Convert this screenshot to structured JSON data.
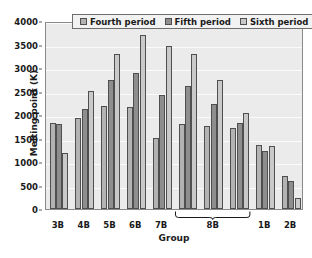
{
  "chart_data": {
    "type": "bar",
    "title": "",
    "xlabel": "Group",
    "ylabel": "Melting point (K)",
    "ylim": [
      0,
      4000
    ],
    "ytick_labels": [
      "0",
      "500",
      "1000",
      "1500",
      "2000",
      "2500",
      "3000",
      "3500",
      "4000"
    ],
    "ytick_values": [
      0,
      500,
      1000,
      1500,
      2000,
      2500,
      3000,
      3500,
      4000
    ],
    "grid": true,
    "legend_position": "top-center",
    "categories": [
      "3B",
      "4B",
      "5B",
      "6B",
      "7B",
      "8B",
      "8B",
      "8B",
      "1B",
      "2B"
    ],
    "xtick_labels": [
      "3B",
      "4B",
      "5B",
      "6B",
      "7B",
      "8B",
      "1B",
      "2B"
    ],
    "bracket_label": "8B",
    "bracket_spans_groups": 3,
    "series": [
      {
        "name": "Fourth period",
        "color": "#b3b3b3",
        "values": [
          1828,
          1941,
          2183,
          2180,
          1519,
          1811,
          1768,
          1728,
          1358,
          693
        ]
      },
      {
        "name": "Fifth period",
        "color": "#8e8e8e",
        "values": [
          1799,
          2128,
          2750,
          2896,
          2430,
          2607,
          2237,
          1828,
          1235,
          594
        ]
      },
      {
        "name": "Sixth period",
        "color": "#c9c9c9",
        "values": [
          1193,
          2506,
          3290,
          3695,
          3459,
          3306,
          2739,
          2041,
          1337,
          234
        ]
      }
    ]
  },
  "legend": {
    "entries": [
      {
        "label": "Fourth period",
        "swatch": "p4"
      },
      {
        "label": "Fifth period",
        "swatch": "p5"
      },
      {
        "label": "Sixth period",
        "swatch": "p6"
      }
    ]
  }
}
